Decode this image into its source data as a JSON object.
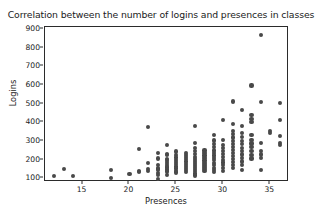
{
  "chart_data": {
    "type": "scatter",
    "title": "Correlation between the number of logins and presences in classes",
    "xlabel": "Presences",
    "ylabel": "Logins",
    "xlim": [
      11,
      37
    ],
    "ylim": [
      80,
      910
    ],
    "xticks": [
      15,
      20,
      25,
      30,
      35
    ],
    "yticks": [
      100,
      200,
      300,
      400,
      500,
      600,
      700,
      800,
      900
    ],
    "grid": false,
    "legend": "none",
    "marker_color": "#494949",
    "frame_color": "#2b2b2b",
    "background_color": "#ffffff",
    "series": [
      {
        "name": "students",
        "points": [
          [
            12,
            113
          ],
          [
            13,
            149
          ],
          [
            14,
            112
          ],
          [
            18,
            146
          ],
          [
            18,
            103
          ],
          [
            20,
            125
          ],
          [
            21,
            257
          ],
          [
            21,
            141
          ],
          [
            21,
            133
          ],
          [
            22,
            376
          ],
          [
            22,
            183
          ],
          [
            22,
            148
          ],
          [
            22,
            139
          ],
          [
            23,
            234
          ],
          [
            23,
            206
          ],
          [
            23,
            172
          ],
          [
            23,
            152
          ],
          [
            23,
            147
          ],
          [
            23,
            130
          ],
          [
            23,
            117
          ],
          [
            23,
            96
          ],
          [
            24,
            276
          ],
          [
            24,
            229
          ],
          [
            24,
            224
          ],
          [
            24,
            205
          ],
          [
            24,
            196
          ],
          [
            24,
            188
          ],
          [
            24,
            177
          ],
          [
            24,
            166
          ],
          [
            24,
            158
          ],
          [
            24,
            147
          ],
          [
            24,
            136
          ],
          [
            24,
            118
          ],
          [
            25,
            243
          ],
          [
            25,
            223
          ],
          [
            25,
            211
          ],
          [
            25,
            197
          ],
          [
            25,
            186
          ],
          [
            25,
            175
          ],
          [
            25,
            163
          ],
          [
            25,
            152
          ],
          [
            25,
            141
          ],
          [
            25,
            131
          ],
          [
            26,
            236
          ],
          [
            26,
            224
          ],
          [
            26,
            213
          ],
          [
            26,
            201
          ],
          [
            26,
            190
          ],
          [
            26,
            178
          ],
          [
            26,
            167
          ],
          [
            26,
            156
          ],
          [
            26,
            144
          ],
          [
            26,
            133
          ],
          [
            27,
            381
          ],
          [
            27,
            288
          ],
          [
            27,
            264
          ],
          [
            27,
            247
          ],
          [
            27,
            231
          ],
          [
            27,
            214
          ],
          [
            27,
            203
          ],
          [
            27,
            192
          ],
          [
            27,
            181
          ],
          [
            27,
            170
          ],
          [
            27,
            159
          ],
          [
            27,
            148
          ],
          [
            27,
            137
          ],
          [
            27,
            126
          ],
          [
            27,
            115
          ],
          [
            28,
            249
          ],
          [
            28,
            236
          ],
          [
            28,
            222
          ],
          [
            28,
            208
          ],
          [
            28,
            195
          ],
          [
            28,
            183
          ],
          [
            28,
            172
          ],
          [
            28,
            161
          ],
          [
            28,
            150
          ],
          [
            28,
            139
          ],
          [
            29,
            331
          ],
          [
            29,
            302
          ],
          [
            29,
            283
          ],
          [
            29,
            266
          ],
          [
            29,
            249
          ],
          [
            29,
            236
          ],
          [
            29,
            222
          ],
          [
            29,
            209
          ],
          [
            29,
            196
          ],
          [
            29,
            183
          ],
          [
            29,
            170
          ],
          [
            29,
            157
          ],
          [
            29,
            144
          ],
          [
            29,
            133
          ],
          [
            30,
            414
          ],
          [
            30,
            303
          ],
          [
            30,
            279
          ],
          [
            30,
            261
          ],
          [
            30,
            245
          ],
          [
            30,
            230
          ],
          [
            30,
            214
          ],
          [
            30,
            199
          ],
          [
            30,
            184
          ],
          [
            30,
            169
          ],
          [
            30,
            154
          ],
          [
            30,
            139
          ],
          [
            31,
            511
          ],
          [
            31,
            391
          ],
          [
            31,
            355
          ],
          [
            31,
            336
          ],
          [
            31,
            318
          ],
          [
            31,
            301
          ],
          [
            31,
            284
          ],
          [
            31,
            268
          ],
          [
            31,
            252
          ],
          [
            31,
            236
          ],
          [
            31,
            220
          ],
          [
            31,
            204
          ],
          [
            31,
            188
          ],
          [
            31,
            172
          ],
          [
            31,
            157
          ],
          [
            32,
            466
          ],
          [
            32,
            379
          ],
          [
            32,
            344
          ],
          [
            32,
            322
          ],
          [
            32,
            301
          ],
          [
            32,
            282
          ],
          [
            32,
            263
          ],
          [
            32,
            245
          ],
          [
            32,
            227
          ],
          [
            32,
            208
          ],
          [
            32,
            190
          ],
          [
            32,
            171
          ],
          [
            32,
            143
          ],
          [
            33,
            597
          ],
          [
            33,
            437
          ],
          [
            33,
            418
          ],
          [
            33,
            401
          ],
          [
            33,
            331
          ],
          [
            33,
            307
          ],
          [
            33,
            286
          ],
          [
            33,
            266
          ],
          [
            33,
            246
          ],
          [
            33,
            226
          ],
          [
            33,
            206
          ],
          [
            34,
            865
          ],
          [
            34,
            509
          ],
          [
            34,
            287
          ],
          [
            34,
            248
          ],
          [
            34,
            227
          ],
          [
            34,
            208
          ],
          [
            34,
            146
          ],
          [
            35,
            352
          ],
          [
            35,
            344
          ],
          [
            36,
            501
          ],
          [
            36,
            411
          ],
          [
            36,
            326
          ],
          [
            36,
            290
          ],
          [
            36,
            280
          ]
        ]
      }
    ]
  }
}
